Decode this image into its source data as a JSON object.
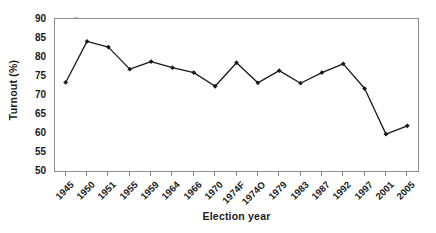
{
  "chart_data": {
    "type": "line",
    "title": "",
    "xlabel": "Election year",
    "ylabel": "Turnout (%)",
    "categories": [
      "1945",
      "1950",
      "1951",
      "1955",
      "1959",
      "1964",
      "1966",
      "1970",
      "1974F",
      "1974O",
      "1979",
      "1983",
      "1987",
      "1992",
      "1997",
      "2001",
      "2005"
    ],
    "values": [
      73.3,
      84.1,
      82.6,
      76.8,
      78.8,
      77.2,
      75.9,
      72.3,
      78.5,
      73.2,
      76.4,
      73.1,
      75.9,
      78.2,
      71.7,
      59.7,
      61.9
    ],
    "series": [
      {
        "name": "Turnout",
        "values": [
          73.3,
          84.1,
          82.6,
          76.8,
          78.8,
          77.2,
          75.9,
          72.3,
          78.5,
          73.2,
          76.4,
          73.1,
          75.9,
          78.2,
          71.7,
          59.7,
          61.9
        ]
      }
    ],
    "ylim": [
      50,
      90
    ],
    "y_ticks": [
      50,
      55,
      60,
      65,
      70,
      75,
      80,
      85,
      90
    ],
    "y_tick_labels": [
      "50",
      "55",
      "60",
      "65",
      "70",
      "75",
      "80",
      "85",
      "90"
    ],
    "grid": false,
    "legend": false,
    "legend_position": "none",
    "marker": "diamond",
    "line_color": "#1a1a1a",
    "marker_color": "#1a1a1a",
    "frame_color": "#8c8c8c",
    "background_color": "#ffffff"
  }
}
